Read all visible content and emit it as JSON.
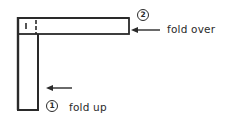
{
  "diagram": {
    "type": "folding-instruction",
    "steps": [
      {
        "number": "1",
        "label": "fold up",
        "arrow_direction": "left"
      },
      {
        "number": "2",
        "label": "fold over",
        "arrow_direction": "left"
      }
    ],
    "shape": "L-shaped strip",
    "colors": {
      "stroke": "#2a2a2a",
      "background": "#ffffff"
    }
  }
}
